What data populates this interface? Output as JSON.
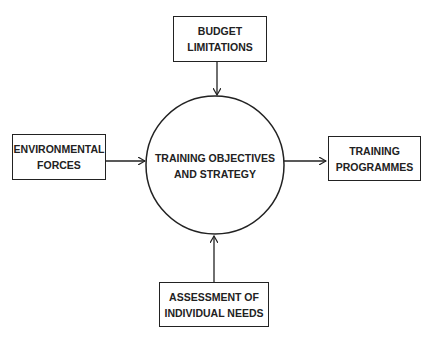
{
  "diagram": {
    "center": {
      "lines": [
        "TRAINING OBJECTIVES",
        "AND STRATEGY"
      ]
    },
    "top": {
      "lines": [
        "BUDGET",
        "LIMITATIONS"
      ]
    },
    "left": {
      "lines": [
        "ENVIRONMENTAL",
        "FORCES"
      ]
    },
    "right": {
      "lines": [
        "TRAINING",
        "PROGRAMMES"
      ]
    },
    "bottom": {
      "lines": [
        "ASSESSMENT OF",
        "INDIVIDUAL NEEDS"
      ]
    }
  },
  "colors": {
    "stroke": "#222222",
    "background": "#ffffff"
  }
}
